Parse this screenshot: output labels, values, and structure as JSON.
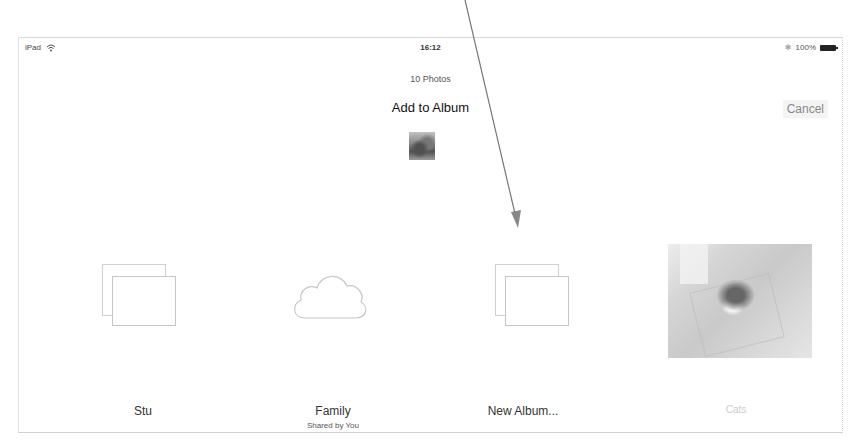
{
  "status_bar": {
    "device": "iPad",
    "wifi_icon": "wifi-icon",
    "time": "16:12",
    "bluetooth_icon": "bluetooth-icon",
    "battery_percent": "100%",
    "battery_icon": "battery-full-icon"
  },
  "header": {
    "photo_count": "10 Photos",
    "title": "Add to Album",
    "cancel_label": "Cancel"
  },
  "albums": [
    {
      "label": "Stu",
      "sublabel": "",
      "icon": "album-stack-icon"
    },
    {
      "label": "Family",
      "sublabel": "Shared by You",
      "icon": "icloud-shared-icon"
    },
    {
      "label": "New Album...",
      "sublabel": "",
      "icon": "album-stack-icon"
    },
    {
      "label": "Cats",
      "sublabel": "",
      "icon": "album-photo-thumbnail"
    }
  ],
  "annotation": {
    "type": "arrow",
    "points_to": "New Album...",
    "color": "#777777"
  },
  "colors": {
    "background": "#ffffff",
    "text_primary": "#111111",
    "text_secondary": "#555555",
    "cancel_text": "#888888",
    "icon_outline": "#c6c6c6"
  }
}
